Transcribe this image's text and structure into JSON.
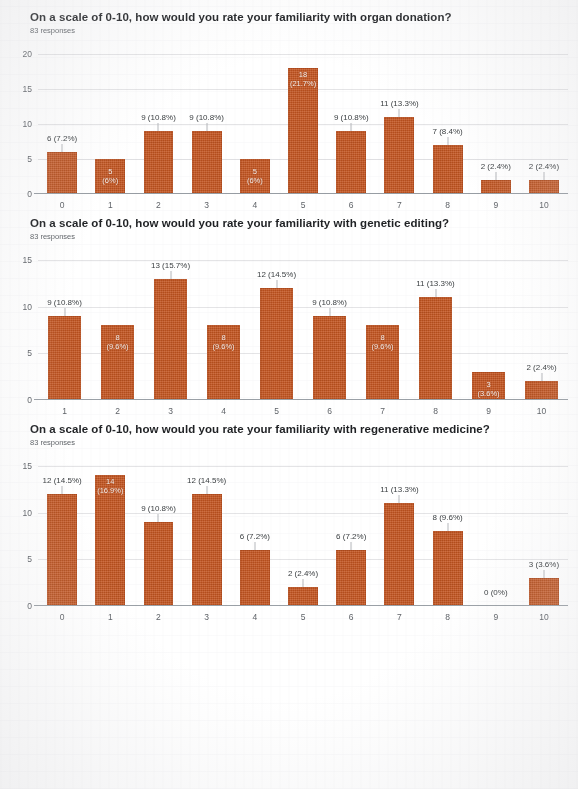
{
  "page": {
    "response_count_label": "83 responses"
  },
  "questions": [
    {
      "title": "On a scale of 0-10, how would you rate your familiarity with organ donation?",
      "subtitle": "83 responses"
    },
    {
      "title": "On a scale of 0-10, how would you rate your familiarity with genetic editing?",
      "subtitle": "83 responses"
    },
    {
      "title": "On a scale of 0-10, how would you rate your familiarity with regenerative medicine?",
      "subtitle": "83 responses"
    }
  ],
  "style": {
    "bar_color": "#c4541f",
    "grid_color": "#e4e4e6",
    "axis_color": "#9aa0a6",
    "title_color": "#1f2124",
    "subtitle_color": "#5f6368"
  },
  "chart_data": [
    {
      "type": "bar",
      "title": "On a scale of 0-10, how would you rate your familiarity with organ donation?",
      "subtitle": "83 responses",
      "xlabel": "",
      "ylabel": "",
      "categories": [
        "0",
        "1",
        "2",
        "3",
        "4",
        "5",
        "6",
        "7",
        "8",
        "9",
        "10"
      ],
      "values": [
        6,
        5,
        9,
        9,
        5,
        18,
        9,
        11,
        7,
        2,
        2
      ],
      "data_labels": [
        "6 (7.2%)",
        "5 (6%)",
        "9 (10.8%)",
        "9 (10.8%)",
        "5 (6%)",
        "18 (21.7%)",
        "9 (10.8%)",
        "11 (13.3%)",
        "7 (8.4%)",
        "2 (2.4%)",
        "2 (2.4%)"
      ],
      "label_inside": [
        false,
        true,
        false,
        false,
        true,
        true,
        false,
        false,
        false,
        false,
        false
      ],
      "ylim": [
        0,
        20
      ],
      "yticks": [
        0,
        5,
        10,
        15,
        20
      ],
      "grid": true,
      "legend": "none"
    },
    {
      "type": "bar",
      "title": "On a scale of 0-10, how would you rate your familiarity with genetic editing?",
      "subtitle": "83 responses",
      "xlabel": "",
      "ylabel": "",
      "categories": [
        "1",
        "2",
        "3",
        "4",
        "5",
        "6",
        "7",
        "8",
        "9",
        "10"
      ],
      "values": [
        9,
        8,
        13,
        8,
        12,
        9,
        8,
        11,
        3,
        2
      ],
      "data_labels": [
        "9 (10.8%)",
        "8 (9.6%)",
        "13 (15.7%)",
        "8 (9.6%)",
        "12 (14.5%)",
        "9 (10.8%)",
        "8 (9.6%)",
        "11 (13.3%)",
        "3 (3.6%)",
        "2 (2.4%)"
      ],
      "label_inside": [
        false,
        true,
        false,
        true,
        false,
        false,
        true,
        false,
        true,
        false
      ],
      "ylim": [
        0,
        15
      ],
      "yticks": [
        0,
        5,
        10,
        15
      ],
      "grid": true,
      "legend": "none"
    },
    {
      "type": "bar",
      "title": "On a scale of 0-10, how would you rate your familiarity with regenerative medicine?",
      "subtitle": "83 responses",
      "xlabel": "",
      "ylabel": "",
      "categories": [
        "0",
        "1",
        "2",
        "3",
        "4",
        "5",
        "6",
        "7",
        "8",
        "9",
        "10"
      ],
      "values": [
        12,
        14,
        9,
        12,
        6,
        2,
        6,
        11,
        8,
        0,
        3
      ],
      "data_labels": [
        "12 (14.5%)",
        "14 (16.9%)",
        "9 (10.8%)",
        "12 (14.5%)",
        "6 (7.2%)",
        "2 (2.4%)",
        "6 (7.2%)",
        "11 (13.3%)",
        "8 (9.6%)",
        "0 (0%)",
        "3 (3.6%)"
      ],
      "label_inside": [
        false,
        true,
        false,
        false,
        false,
        false,
        false,
        false,
        false,
        false,
        false
      ],
      "ylim": [
        0,
        15
      ],
      "yticks": [
        0,
        5,
        10,
        15
      ],
      "grid": true,
      "legend": "none"
    }
  ]
}
